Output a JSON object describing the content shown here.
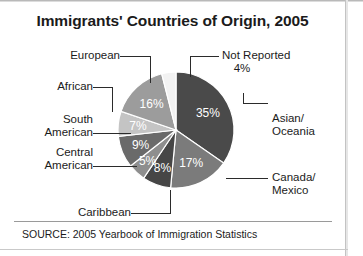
{
  "title": "Immigrants' Countries of Origin, 2005",
  "source": "SOURCE: 2005 Yearbook of Immigration Statistics",
  "labels": {
    "european": "European",
    "not_reported": "Not Reported",
    "not_reported_pct": "4%",
    "african": "African",
    "south_american_1": "South",
    "south_american_2": "American",
    "central_american_1": "Central",
    "central_american_2": "American",
    "caribbean": "Caribbean",
    "asian_1": "Asian/",
    "asian_2": "Oceania",
    "canada_1": "Canada/",
    "canada_2": "Mexico"
  },
  "slice_labels": {
    "asian": "35%",
    "canada": "17%",
    "caribbean": "8%",
    "central": "5%",
    "south": "9%",
    "african": "7%",
    "european": "16%"
  },
  "chart_data": {
    "type": "pie",
    "title": "Immigrants' Countries of Origin, 2005",
    "xlabel": "",
    "ylabel": "",
    "legend": "none",
    "grid": false,
    "source": "SOURCE: 2005 Yearbook of Immigration Statistics",
    "start_angle_deg": 0,
    "direction": "clockwise",
    "categories": [
      "Asian/Oceania",
      "Canada/Mexico",
      "Caribbean",
      "Central American",
      "South American",
      "African",
      "European",
      "Not Reported"
    ],
    "values": [
      35,
      17,
      8,
      5,
      9,
      7,
      16,
      4
    ],
    "labels": [
      "35%",
      "17%",
      "8%",
      "5%",
      "9%",
      "7%",
      "16%",
      "4%"
    ],
    "units": "percent",
    "colors": [
      "#4a4a4a",
      "#7b7b7b",
      "#464646",
      "#8e8e8e",
      "#6a6a6a",
      "#c4c4c4",
      "#9c9c9c",
      "#f2f2f2"
    ],
    "center_px": [
      176,
      130
    ],
    "radius_px": 58
  }
}
